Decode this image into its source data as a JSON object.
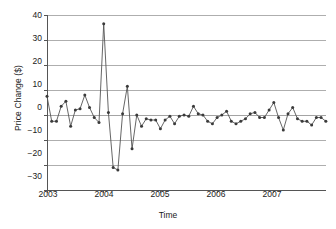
{
  "chart_data": {
    "type": "line",
    "title": "",
    "subtitle": "",
    "xlabel": "Time",
    "ylabel": "Price Change ($)",
    "xlim": [
      2003.0,
      2007.92
    ],
    "ylim": [
      -30,
      40
    ],
    "ytick_values": [
      40,
      30,
      20,
      10,
      0,
      -10,
      -20,
      -30
    ],
    "ytick_labels": [
      "40",
      "30",
      "20",
      "10",
      "0",
      "−10",
      "−20",
      "−30"
    ],
    "xtick_values": [
      2003,
      2004,
      2005,
      2006,
      2007
    ],
    "xtick_labels": [
      "2003",
      "2004",
      "2005",
      "2006",
      "2007"
    ],
    "grid": "horizontal",
    "legend": "none",
    "marker": "filled-circle",
    "line_color": "#555555",
    "marker_color": "#3a3a3a",
    "grid_color": "#9a9a9a",
    "axis_color": "#555555",
    "background": "#ffffff",
    "series": [
      {
        "name": "Price Change",
        "x": [
          2003.0,
          2003.083,
          2003.167,
          2003.25,
          2003.333,
          2003.417,
          2003.5,
          2003.583,
          2003.667,
          2003.75,
          2003.833,
          2003.917,
          2004.0,
          2004.083,
          2004.167,
          2004.25,
          2004.333,
          2004.417,
          2004.5,
          2004.583,
          2004.667,
          2004.75,
          2004.833,
          2004.917,
          2005.0,
          2005.083,
          2005.167,
          2005.25,
          2005.333,
          2005.417,
          2005.5,
          2005.583,
          2005.667,
          2005.75,
          2005.833,
          2005.917,
          2006.0,
          2006.083,
          2006.167,
          2006.25,
          2006.333,
          2006.417,
          2006.5,
          2006.583,
          2006.667,
          2006.75,
          2006.833,
          2006.917,
          2007.0,
          2007.083,
          2007.167,
          2007.25,
          2007.333,
          2007.417,
          2007.5,
          2007.583,
          2007.667,
          2007.75,
          2007.833,
          2007.917
        ],
        "values": [
          7.5,
          -2.5,
          -2.5,
          3.5,
          5.5,
          -4.5,
          2.0,
          2.5,
          8.0,
          3.0,
          -1.0,
          -3.0,
          36.5,
          1.0,
          -21.0,
          -22.0,
          0.5,
          11.5,
          -13.5,
          0.0,
          -4.5,
          -1.5,
          -2.0,
          -2.0,
          -5.5,
          -2.0,
          -0.5,
          -3.5,
          -0.5,
          0.0,
          -0.5,
          3.5,
          0.5,
          0.0,
          -2.5,
          -3.5,
          -1.0,
          0.0,
          1.5,
          -2.5,
          -3.5,
          -2.5,
          -1.5,
          0.5,
          1.0,
          -1.0,
          -1.0,
          2.0,
          5.0,
          -1.0,
          -6.0,
          0.5,
          3.0,
          -1.5,
          -2.5,
          -2.5,
          -4.0,
          -1.0,
          -1.0,
          -2.5
        ]
      }
    ]
  },
  "axes": {
    "y_title": "Price Change ($)",
    "x_title": "Time"
  }
}
